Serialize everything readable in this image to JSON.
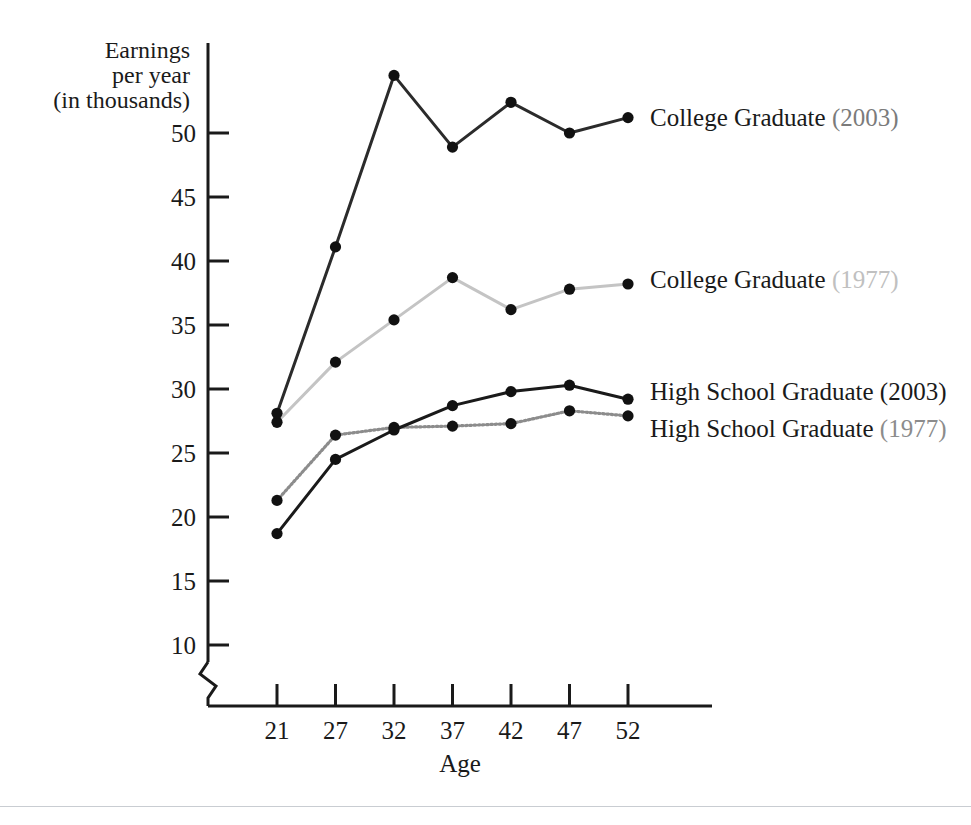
{
  "chart_data": {
    "type": "line",
    "title": "",
    "xlabel": "Age",
    "ylabel_lines": [
      "Earnings",
      "per year",
      "(in thousands)"
    ],
    "ylabel": "Earnings per year (in thousands)",
    "categories": [
      21,
      27,
      32,
      37,
      42,
      47,
      52
    ],
    "xtick_labels": [
      "21",
      "27",
      "32",
      "37",
      "42",
      "47",
      "52"
    ],
    "ytick_labels": [
      "10",
      "15",
      "20",
      "25",
      "30",
      "35",
      "40",
      "45",
      "50"
    ],
    "yticks": [
      10,
      15,
      20,
      25,
      30,
      35,
      40,
      45,
      50
    ],
    "ylim": [
      7.5,
      56
    ],
    "axis_break": true,
    "grid": false,
    "legend_position": "right-inline",
    "series": [
      {
        "name": "College Graduate",
        "year": "(2003)",
        "label": "College Graduate (2003)",
        "color": "#2b2b2b",
        "year_color": "#7b7b7b",
        "style": "solid",
        "values": [
          28.1,
          41.1,
          54.5,
          48.9,
          52.4,
          50.0,
          51.2
        ]
      },
      {
        "name": "College Graduate",
        "year": "(1977)",
        "label": "College Graduate (1977)",
        "color": "#c4c4c4",
        "year_color": "#c0c0c0",
        "style": "solid",
        "values": [
          27.4,
          32.1,
          35.4,
          38.7,
          36.2,
          37.8,
          38.2
        ]
      },
      {
        "name": "High School Graduate",
        "year": "(2003)",
        "label": "High School Graduate (2003)",
        "color": "#1a1a1a",
        "year_color": "#1a1a1a",
        "style": "solid",
        "values": [
          18.7,
          24.5,
          26.8,
          28.7,
          29.8,
          30.3,
          29.2
        ]
      },
      {
        "name": "High School Graduate",
        "year": "(1977)",
        "label": "High School Graduate (1977)",
        "color": "#8c8c8c",
        "year_color": "#8c8c8c",
        "style": "dotted",
        "values": [
          21.3,
          26.4,
          27.0,
          27.1,
          27.3,
          28.3,
          27.9
        ]
      }
    ]
  },
  "legend": {
    "entries": [
      {
        "name": "College Graduate ",
        "year": "(2003)"
      },
      {
        "name": "College Graduate ",
        "year": "(1977)"
      },
      {
        "name": "High School Graduate ",
        "year": "(2003)"
      },
      {
        "name": "High School Graduate ",
        "year": "(1977)"
      }
    ]
  },
  "axes": {
    "y_title_1": "Earnings",
    "y_title_2": "per year",
    "y_title_3": "(in thousands)",
    "x_title": "Age",
    "yticks": [
      "50",
      "45",
      "40",
      "35",
      "30",
      "25",
      "20",
      "15",
      "10"
    ],
    "xticks": [
      "21",
      "27",
      "32",
      "37",
      "42",
      "47",
      "52"
    ]
  }
}
